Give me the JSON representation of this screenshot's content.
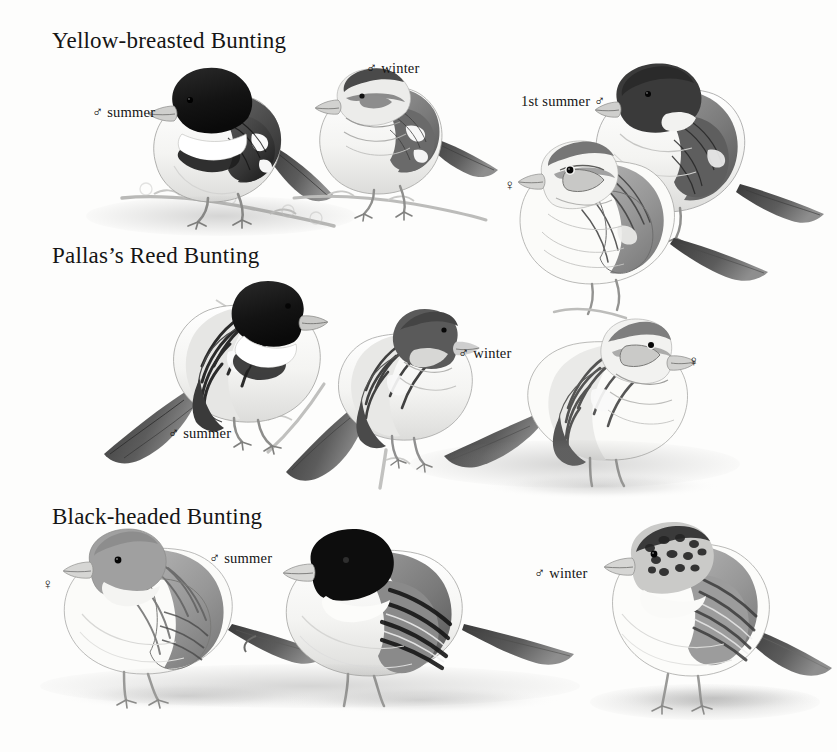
{
  "page": {
    "type": "field-guide-plate",
    "background_color": "#fdfdfc",
    "ink_color": "#1a1a1a",
    "width": 837,
    "height": 752
  },
  "species": [
    {
      "id": "yellow-breasted-bunting",
      "heading": "Yellow-breasted Bunting",
      "heading_pos": {
        "x": 52,
        "y": 28
      }
    },
    {
      "id": "pallass-reed-bunting",
      "heading": "Pallas’s Reed Bunting",
      "heading_pos": {
        "x": 52,
        "y": 243
      }
    },
    {
      "id": "black-headed-bunting",
      "heading": "Black-headed Bunting",
      "heading_pos": {
        "x": 52,
        "y": 504
      }
    }
  ],
  "captions": [
    {
      "id": "ybb-male-summer",
      "symbol": "♂",
      "text": "summer",
      "order": "symbol-first",
      "x": 92,
      "y": 104
    },
    {
      "id": "ybb-male-winter",
      "symbol": "♂",
      "text": "winter",
      "order": "symbol-first",
      "x": 366,
      "y": 60
    },
    {
      "id": "ybb-1st-summer",
      "symbol": "♂",
      "text": "1st summer",
      "order": "text-first",
      "x": 521,
      "y": 93
    },
    {
      "id": "ybb-female",
      "symbol": "♀",
      "text": "",
      "order": "symbol-only",
      "x": 504,
      "y": 176
    },
    {
      "id": "prb-male-summer",
      "symbol": "♂",
      "text": "summer",
      "order": "symbol-first",
      "x": 168,
      "y": 425
    },
    {
      "id": "prb-male-winter",
      "symbol": "♂",
      "text": "winter",
      "order": "symbol-first",
      "x": 458,
      "y": 345
    },
    {
      "id": "prb-female",
      "symbol": "♀",
      "text": "",
      "order": "symbol-only",
      "x": 688,
      "y": 352
    },
    {
      "id": "bhb-female",
      "symbol": "♀",
      "text": "",
      "order": "symbol-only",
      "x": 42,
      "y": 575
    },
    {
      "id": "bhb-male-summer",
      "symbol": "♂",
      "text": "summer",
      "order": "symbol-first",
      "x": 209,
      "y": 550
    },
    {
      "id": "bhb-male-winter",
      "symbol": "♂",
      "text": "winter",
      "order": "symbol-first",
      "x": 534,
      "y": 565
    }
  ],
  "figures": [
    {
      "id": "ybb-male-summer-bird",
      "species": "yellow-breasted-bunting",
      "plumage": "male summer",
      "facing": "left",
      "perch": "branch",
      "head_color": "#1d1d1d",
      "back_color": "#555555",
      "belly_color": "#f4f4f2"
    },
    {
      "id": "ybb-male-winter-bird",
      "species": "yellow-breasted-bunting",
      "plumage": "male winter",
      "facing": "left",
      "perch": "branch",
      "head_color": "#6e6e6e",
      "back_color": "#777777",
      "belly_color": "#f6f6f4"
    },
    {
      "id": "ybb-1st-summer-bird",
      "species": "yellow-breasted-bunting",
      "plumage": "1st summer male",
      "facing": "left",
      "perch": "none",
      "head_color": "#3a3a3a",
      "back_color": "#6a6a6a",
      "belly_color": "#f2f2f0"
    },
    {
      "id": "ybb-female-bird",
      "species": "yellow-breasted-bunting",
      "plumage": "female",
      "facing": "left",
      "perch": "branch",
      "head_color": "#8b8b8b",
      "back_color": "#7d7d7d",
      "belly_color": "#f7f7f5"
    },
    {
      "id": "prb-male-summer-bird",
      "species": "pallass-reed-bunting",
      "plumage": "male summer",
      "facing": "right",
      "perch": "stem",
      "head_color": "#1c1c1c",
      "back_color": "#5e5e5e",
      "belly_color": "#f5f5f3"
    },
    {
      "id": "prb-male-winter-bird",
      "species": "pallass-reed-bunting",
      "plumage": "male winter",
      "facing": "right",
      "perch": "stem",
      "head_color": "#5a5a5a",
      "back_color": "#6d6d6d",
      "belly_color": "#f6f6f4"
    },
    {
      "id": "prb-female-bird",
      "species": "pallass-reed-bunting",
      "plumage": "female",
      "facing": "right",
      "perch": "ground",
      "head_color": "#8a8a8a",
      "back_color": "#757575",
      "belly_color": "#f7f7f5"
    },
    {
      "id": "bhb-female-bird",
      "species": "black-headed-bunting",
      "plumage": "female",
      "facing": "left",
      "perch": "ground",
      "head_color": "#8e8e8e",
      "back_color": "#858585",
      "belly_color": "#f8f8f6"
    },
    {
      "id": "bhb-male-summer-bird",
      "species": "black-headed-bunting",
      "plumage": "male summer",
      "facing": "left",
      "perch": "ground",
      "head_color": "#111111",
      "back_color": "#6e6e6e",
      "belly_color": "#f6f6f4"
    },
    {
      "id": "bhb-male-winter-bird",
      "species": "black-headed-bunting",
      "plumage": "male winter",
      "facing": "left",
      "perch": "ground",
      "head_color": "#3d3d3d",
      "back_color": "#8a8a8a",
      "belly_color": "#f8f8f6"
    }
  ]
}
